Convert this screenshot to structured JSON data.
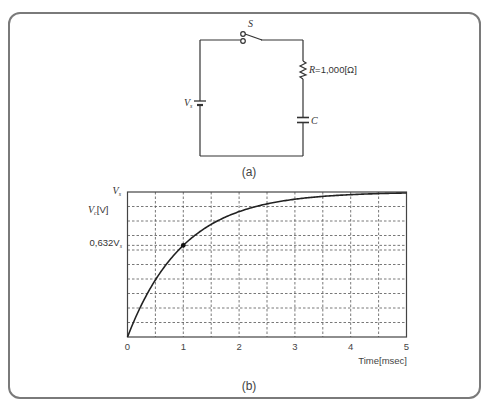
{
  "figure": {
    "panel_a": {
      "caption": "(a)",
      "switch_label": "S",
      "source_label": "V",
      "source_subscript": "s",
      "resistor_label": "R = 1,000[Ω]",
      "resistor_label_prefix": "R",
      "resistor_label_value": "=1,000[Ω]",
      "capacitor_label": "C"
    },
    "panel_b": {
      "caption": "(b)",
      "y_top_label": "V",
      "y_top_subscript": "s",
      "y_axis_label": "V",
      "y_axis_subscript": "c",
      "y_axis_unit": "[V]",
      "marker_label_value": "0,632V",
      "marker_label_subscript": "s",
      "x_axis_label": "Time[msec]",
      "x_ticks": [
        "0",
        "1",
        "2",
        "3",
        "4",
        "5"
      ]
    }
  },
  "chart_data": {
    "type": "line",
    "title": "",
    "xlabel": "Time[msec]",
    "ylabel": "Vc[V]",
    "xlim": [
      0,
      5
    ],
    "ylim": [
      0,
      1
    ],
    "y_unit": "fraction of Vs",
    "grid": true,
    "x_ticks": [
      0,
      1,
      2,
      3,
      4,
      5
    ],
    "x_minor_grid_step": 0.5,
    "y_grid_step": 0.1,
    "annotations": [
      {
        "x": 1,
        "y": 0.632,
        "label": "0,632Vs",
        "marker": "dot"
      },
      {
        "y": 1.0,
        "label": "Vs"
      }
    ],
    "series": [
      {
        "name": "Vc(t) = Vs(1 - e^(-t/τ)), τ = 1 ms",
        "x": [
          0,
          0.25,
          0.5,
          0.75,
          1,
          1.5,
          2,
          2.5,
          3,
          3.5,
          4,
          4.5,
          5
        ],
        "values": [
          0,
          0.221,
          0.393,
          0.528,
          0.632,
          0.777,
          0.865,
          0.918,
          0.95,
          0.97,
          0.982,
          0.989,
          0.993
        ]
      }
    ]
  }
}
